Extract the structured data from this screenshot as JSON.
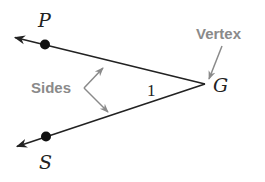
{
  "diagram": {
    "colors": {
      "ray": "#222222",
      "point": "#111111",
      "callout": "#8a8a8a",
      "background": "#ffffff"
    },
    "vertex": {
      "label": "G",
      "x": 205,
      "y": 84
    },
    "points": [
      {
        "label": "P",
        "x": 45,
        "y": 44
      },
      {
        "label": "S",
        "x": 46,
        "y": 136
      }
    ],
    "rays": [
      {
        "from": "G",
        "through": "P",
        "end": [
          14,
          37
        ]
      },
      {
        "from": "G",
        "through": "S",
        "end": [
          16,
          147
        ]
      }
    ],
    "angle_label": "1",
    "callouts": {
      "vertex": "Vertex",
      "sides": "Sides"
    }
  }
}
